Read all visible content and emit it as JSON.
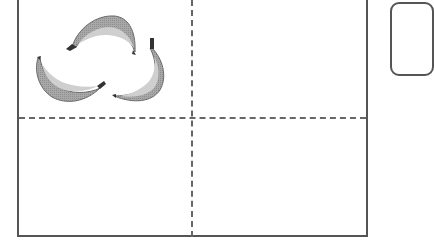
{
  "diagram": {
    "type": "quadrant-grid",
    "quadrants": [
      {
        "position": "top-left",
        "content": "bananas",
        "count": 3
      },
      {
        "position": "top-right",
        "content": "empty",
        "count": 0
      },
      {
        "position": "bottom-left",
        "content": "empty",
        "count": 0
      },
      {
        "position": "bottom-right",
        "content": "empty",
        "count": 0
      }
    ],
    "items": [
      {
        "kind": "banana",
        "icon": "banana-icon",
        "orientation": "top-arch"
      },
      {
        "kind": "banana",
        "icon": "banana-icon",
        "orientation": "left-cradle"
      },
      {
        "kind": "banana",
        "icon": "banana-icon",
        "orientation": "right-hook"
      }
    ],
    "side_box": {
      "content": "empty",
      "partially_visible": true
    },
    "colors": {
      "frame": "#555555",
      "divider": "#666666",
      "banana_fill": "#a8a8a8",
      "banana_dark": "#7a7a7a",
      "banana_light": "#cfcfcf",
      "stem": "#333333",
      "background": "#ffffff"
    }
  }
}
